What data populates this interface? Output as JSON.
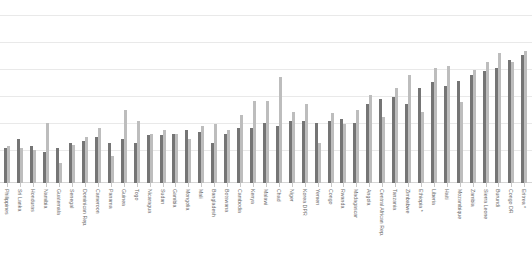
{
  "chart_data": {
    "type": "bar",
    "title": "",
    "subtitle": "",
    "xlabel": "",
    "ylabel": "",
    "ylim": [
      0,
      100
    ],
    "grid": true,
    "grid_values": [
      100,
      83.3,
      66.7,
      50,
      33.3,
      16.7,
      0
    ],
    "legend": [],
    "legend_position": "none",
    "orientation": "vertical",
    "bar_colors": [
      "#757575",
      "#bdbdbd"
    ],
    "note": "* marks countries with an asterisk in the axis label",
    "categories": [
      "Philippines",
      "Sri Lanka",
      "Honduras",
      "Namibia",
      "Guatemala",
      "Senegal",
      "Dominican Rep.",
      "Cameroon",
      "Panama",
      "Guinea",
      "Togo",
      "Nicaragua",
      "Sudan",
      "Gambia",
      "Mongolia",
      "Mali",
      "Bangladesh",
      "Botswana",
      "Cambodia",
      "Kenya",
      "Malawi",
      "Chad",
      "Niger",
      "Korea DPR",
      "Yemen",
      "Congo",
      "Rwanda",
      "Madagascar",
      "Angola",
      "Central African Rep.",
      "Tanzania",
      "Zimbabwe",
      "Ethiopia *",
      "Liberia",
      "Haiti",
      "Mozambique",
      "Zambia",
      "Sierra Leone",
      "Burundi",
      "Congo DR",
      "Eritrea *"
    ],
    "series": [
      {
        "name": "Series 1",
        "color": "#757575",
        "values": [
          19,
          24,
          20,
          17,
          19,
          22,
          23,
          25,
          22,
          24,
          22,
          26,
          26,
          27,
          29,
          28,
          22,
          27,
          30,
          30,
          33,
          31,
          34,
          34,
          33,
          34,
          35,
          33,
          43,
          46,
          47,
          43,
          52,
          55,
          53,
          56,
          59,
          61,
          63,
          67,
          70
        ]
      },
      {
        "name": "Series 2",
        "color": "#bdbdbd",
        "values": [
          20,
          19,
          18,
          33,
          11,
          21,
          25,
          30,
          15,
          40,
          34,
          27,
          29,
          27,
          24,
          31,
          32,
          29,
          37,
          45,
          45,
          58,
          39,
          43,
          22,
          38,
          32,
          40,
          48,
          36,
          52,
          59,
          39,
          63,
          64,
          44,
          62,
          66,
          71,
          66,
          72
        ]
      }
    ]
  }
}
